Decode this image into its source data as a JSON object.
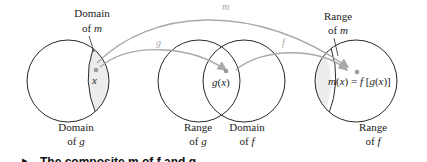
{
  "diagram": {
    "colors": {
      "circle_stroke": "#2a2a2a",
      "shade_fill": "#ececec",
      "arrow": "#a9a9a9",
      "dot": "#9a9a9a"
    },
    "arrows": {
      "m": "m",
      "g": "g",
      "f": "f"
    },
    "labels": {
      "domain_of_m_1": "Domain",
      "domain_of_m_2": "of ",
      "domain_of_m_var": "m",
      "domain_of_g_1": "Domain",
      "domain_of_g_2": "of ",
      "domain_of_g_var": "g",
      "range_of_g_1": "Range",
      "range_of_g_2": "of ",
      "range_of_g_var": "g",
      "domain_of_f_1": "Domain",
      "domain_of_f_2": "of ",
      "domain_of_f_var": "f",
      "range_of_m_1": "Range",
      "range_of_m_2": "of ",
      "range_of_m_var": "m",
      "range_of_f_1": "Range",
      "range_of_f_2": "of ",
      "range_of_f_var": "f"
    },
    "points": {
      "x": "x",
      "gx": "g(x)",
      "mx": "m(x) = f [g(x)]"
    },
    "caption": "The composite m of f and g"
  }
}
